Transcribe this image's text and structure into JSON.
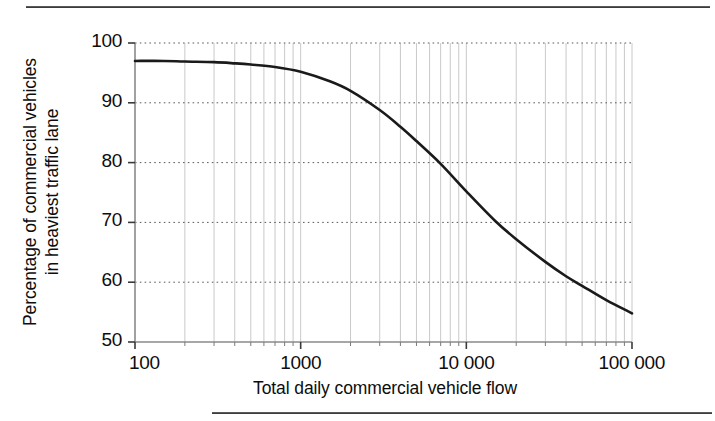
{
  "page": {
    "background": "#ffffff",
    "top_rule": "horizontal-rule",
    "bottom_rule": "horizontal-rule"
  },
  "chart_data": {
    "type": "line",
    "title": "",
    "subtitle": "",
    "xlabel": "Total daily commercial vehicle flow",
    "ylabel": "Percentage of commercial vehicles in heaviest traffic lane",
    "ylabel_lines": [
      "Percentage of commercial vehicles",
      "in heaviest traffic lane"
    ],
    "xscale": "log",
    "yscale": "linear",
    "xlim": [
      100,
      100000
    ],
    "ylim": [
      50,
      100
    ],
    "xticks": [
      100,
      1000,
      10000,
      100000
    ],
    "xtick_labels": [
      "100",
      "1000",
      "10 000",
      "100 000"
    ],
    "yticks": [
      50,
      60,
      70,
      80,
      90,
      100
    ],
    "ytick_labels": [
      "50",
      "60",
      "70",
      "80",
      "90",
      "100"
    ],
    "grid": {
      "horizontal": "dotted",
      "vertical": "solid-minor-log",
      "minor_vertical_multipliers": [
        2,
        3,
        4,
        5,
        6,
        7,
        8,
        9
      ]
    },
    "legend": null,
    "annotations": [],
    "series": [
      {
        "name": "Percentage of commercial vehicles in heaviest traffic lane",
        "color": "#1a1a1a",
        "linewidth": 2.6,
        "x": [
          100,
          150,
          200,
          300,
          400,
          500,
          700,
          1000,
          1500,
          2000,
          3000,
          4000,
          5000,
          7000,
          10000,
          15000,
          20000,
          30000,
          40000,
          50000,
          70000,
          100000
        ],
        "y": [
          97.0,
          97.0,
          96.9,
          96.8,
          96.6,
          96.4,
          96.0,
          95.2,
          93.6,
          92.0,
          88.8,
          86.0,
          83.6,
          79.8,
          75.2,
          70.2,
          67.2,
          63.4,
          61.0,
          59.4,
          57.0,
          54.8
        ]
      }
    ]
  },
  "yticks_data": [
    {
      "label": "100",
      "value": 100
    },
    {
      "label": "90",
      "value": 90
    },
    {
      "label": "80",
      "value": 80
    },
    {
      "label": "70",
      "value": 70
    },
    {
      "label": "60",
      "value": 60
    },
    {
      "label": "50",
      "value": 50
    }
  ],
  "xticks_data": [
    {
      "label": "100",
      "value": 100
    },
    {
      "label": "1000",
      "value": 1000
    },
    {
      "label": "10 000",
      "value": 10000
    },
    {
      "label": "100 000",
      "value": 100000
    }
  ],
  "colors": {
    "curve": "#1a1a1a",
    "axis": "#8a8a8a",
    "grid_minor": "#c9c9c9",
    "grid_dotted": "#5a5a5a",
    "text": "#0d0d0d",
    "rule": "#3d3d3d"
  }
}
